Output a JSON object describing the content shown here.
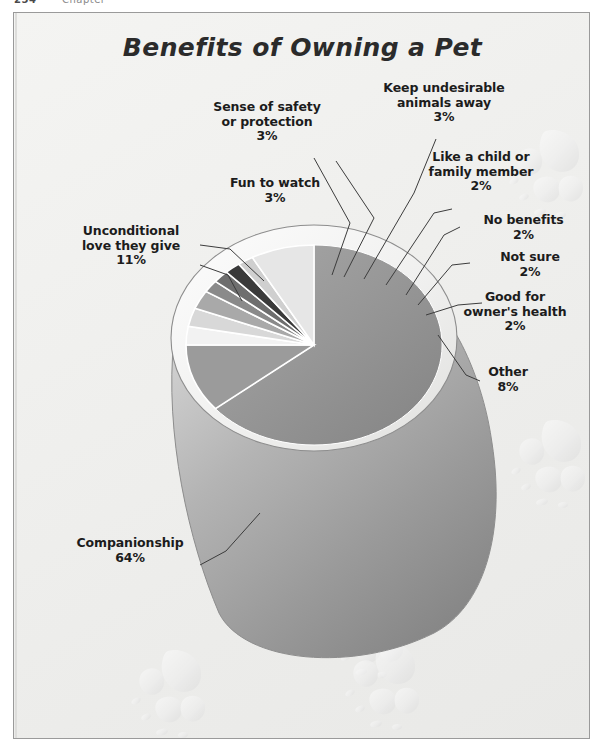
{
  "page_header": {
    "left_fragment": "254",
    "right_fragment": "Chapter"
  },
  "chart_data": {
    "type": "pie",
    "title": "Benefits of Owning a Pet",
    "style": "3d-cone-pie",
    "units": "percent",
    "legend": "none-labels-with-leader-lines",
    "grid": false,
    "categories": [
      "Companionship",
      "Unconditional love they give",
      "Fun to watch",
      "Sense of safety or protection",
      "Keep undesirable animals away",
      "Like a child or family member",
      "No benefits",
      "Not sure",
      "Good for owner's health",
      "Other"
    ],
    "values": [
      64,
      11,
      3,
      3,
      3,
      2,
      2,
      2,
      2,
      8
    ],
    "value_labels": [
      "64%",
      "11%",
      "3%",
      "3%",
      "3%",
      "2%",
      "2%",
      "2%",
      "2%",
      "8%"
    ],
    "slice_colors": [
      "#8f8f8f",
      "#9b9b9b",
      "#f2f2f2",
      "#d8d8d8",
      "#a9a9a9",
      "#8a8a8a",
      "#6e6e6e",
      "#3a3a3a",
      "#cfcfcf",
      "#e6e6e6"
    ]
  },
  "labels": {
    "companionship": {
      "name": "Companionship",
      "pct": "64%"
    },
    "unconditional_love": {
      "name": "Unconditional",
      "name2": "love they give",
      "pct": "11%"
    },
    "fun_to_watch": {
      "name": "Fun to watch",
      "pct": "3%"
    },
    "sense_of_safety": {
      "name": "Sense of safety",
      "name2": "or protection",
      "pct": "3%"
    },
    "keep_animals_away": {
      "name": "Keep undesirable",
      "name2": "animals away",
      "pct": "3%"
    },
    "like_a_child": {
      "name": "Like a child or",
      "name2": "family member",
      "pct": "2%"
    },
    "no_benefits": {
      "name": "No benefits",
      "pct": "2%"
    },
    "not_sure": {
      "name": "Not sure",
      "pct": "2%"
    },
    "owners_health": {
      "name": "Good for",
      "name2": "owner's health",
      "pct": "2%"
    },
    "other": {
      "name": "Other",
      "pct": "8%"
    }
  },
  "decor": {
    "paw_icon": "paw-print-icon",
    "paw_count": 5
  },
  "colors": {
    "frame_border": "#9a9a9a",
    "background": "#f1f1ef",
    "text": "#1c1c1c",
    "leader_line": "#3c3c3c",
    "paw_watermark": "#e3e3e3"
  }
}
